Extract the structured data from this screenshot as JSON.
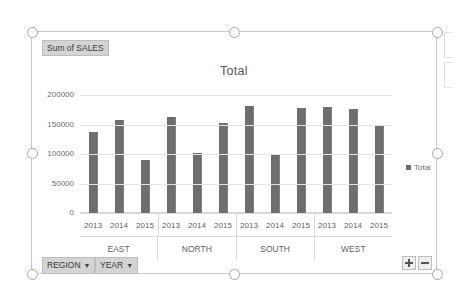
{
  "pivotchart": {
    "value_field_button": "Sum of SALES",
    "title": "Total",
    "region_field_button": "REGION",
    "year_field_button": "YEAR",
    "caret": "▼",
    "legend": [
      {
        "label": "Total",
        "color": "#6e6e6e"
      }
    ],
    "expand_button_label": "+",
    "collapse_button_label": "−"
  },
  "chart_data": {
    "type": "bar",
    "title": "Total",
    "xlabel": "",
    "ylabel": "",
    "ylim": [
      0,
      200000
    ],
    "yticks": [
      0,
      50000,
      100000,
      150000,
      200000
    ],
    "ytick_labels": [
      "0",
      "50000",
      "100000",
      "150000",
      "200000"
    ],
    "grid": true,
    "legend_position": "right",
    "legend_entries": [
      "Total"
    ],
    "groups": [
      "EAST",
      "NORTH",
      "SOUTH",
      "WEST"
    ],
    "subcategories": [
      "2013",
      "2014",
      "2015"
    ],
    "categories": [
      "EAST 2013",
      "EAST 2014",
      "EAST 2015",
      "NORTH 2013",
      "NORTH 2014",
      "NORTH 2015",
      "SOUTH 2013",
      "SOUTH 2014",
      "SOUTH 2015",
      "WEST 2013",
      "WEST 2014",
      "WEST 2015"
    ],
    "series": [
      {
        "name": "Total",
        "color": "#6e6e6e",
        "values": [
          138000,
          157000,
          90000,
          163000,
          101000,
          152000,
          181000,
          98000,
          178000,
          180000,
          177000,
          150000
        ]
      }
    ],
    "bars": [
      {
        "group": "EAST",
        "year": "2013",
        "value": 138000
      },
      {
        "group": "EAST",
        "year": "2014",
        "value": 157000
      },
      {
        "group": "EAST",
        "year": "2015",
        "value": 90000
      },
      {
        "group": "NORTH",
        "year": "2013",
        "value": 163000
      },
      {
        "group": "NORTH",
        "year": "2014",
        "value": 101000
      },
      {
        "group": "NORTH",
        "year": "2015",
        "value": 152000
      },
      {
        "group": "SOUTH",
        "year": "2013",
        "value": 181000
      },
      {
        "group": "SOUTH",
        "year": "2014",
        "value": 98000
      },
      {
        "group": "SOUTH",
        "year": "2015",
        "value": 178000
      },
      {
        "group": "WEST",
        "year": "2013",
        "value": 180000
      },
      {
        "group": "WEST",
        "year": "2014",
        "value": 177000
      },
      {
        "group": "WEST",
        "year": "2015",
        "value": 150000
      }
    ]
  }
}
